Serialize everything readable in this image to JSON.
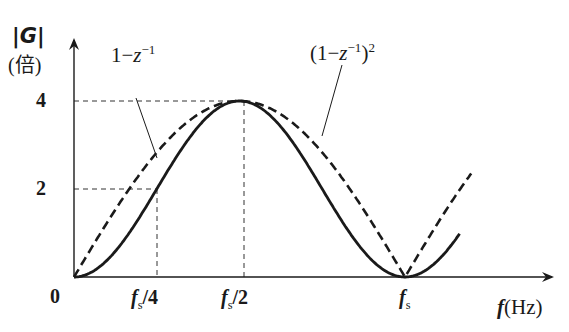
{
  "chart_data": {
    "type": "line",
    "title": "",
    "ylabel": "|G|",
    "ylabel_unit": "(倍)",
    "xlabel": "f(Hz)",
    "xlabel_var": "f",
    "xlabel_unit": "(Hz)",
    "x_ticks": [
      "0",
      "fs/4",
      "fs/2",
      "fs"
    ],
    "y_ticks": [
      "2",
      "4"
    ],
    "ylim": [
      0,
      4.2
    ],
    "xlim_fraction_of_fs": [
      0,
      1.35
    ],
    "grid": false,
    "guides": [
      {
        "type": "dashed",
        "from": "y=4",
        "to": "x=fs/2"
      },
      {
        "type": "dashed",
        "from": "y=2",
        "to": "x=fs/4"
      }
    ],
    "series": [
      {
        "name": "1 - z^-1",
        "style": "dashed",
        "x_fraction_of_fs": [
          0,
          0.125,
          0.25,
          0.375,
          0.5,
          0.625,
          0.75,
          0.875,
          1.0,
          1.125,
          1.2
        ],
        "values": [
          0,
          1.53,
          2.83,
          3.7,
          4.0,
          3.7,
          2.83,
          1.53,
          0,
          1.53,
          2.35
        ]
      },
      {
        "name": "(1 - z^-1)^2",
        "style": "solid",
        "x_fraction_of_fs": [
          0,
          0.125,
          0.25,
          0.375,
          0.5,
          0.625,
          0.75,
          0.875,
          1.0,
          1.125,
          1.165
        ],
        "values": [
          0,
          0.59,
          2.0,
          3.41,
          4.0,
          3.41,
          2.0,
          0.59,
          0,
          0.59,
          0.8
        ]
      }
    ],
    "annotations": [
      {
        "text": "1−z⁻¹",
        "points_to": "dashed curve"
      },
      {
        "text": "(1−z⁻¹)²",
        "points_to": "solid curve"
      }
    ]
  },
  "labels": {
    "y_axis_name": "|G|",
    "y_axis_unit": "(倍)",
    "origin": "0",
    "tick_y4": "4",
    "tick_y2": "2",
    "tick_fs4_f": "f",
    "tick_fs4_sub": "s",
    "tick_fs4_rest": "/4",
    "tick_fs2_f": "f",
    "tick_fs2_sub": "s",
    "tick_fs2_rest": "/2",
    "tick_fs_f": "f",
    "tick_fs_sub": "s",
    "x_axis_var": "f",
    "x_axis_unit": "(Hz)",
    "legend_dashed_main": "1−",
    "legend_dashed_z": "z",
    "legend_dashed_exp": "−1",
    "legend_solid_open": "(1−",
    "legend_solid_z": "z",
    "legend_solid_exp": "−1",
    "legend_solid_close": ")",
    "legend_solid_pow": "2"
  }
}
